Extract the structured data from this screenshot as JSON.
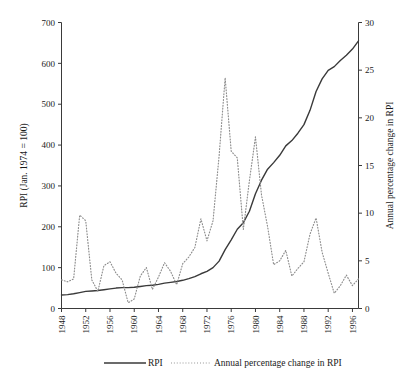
{
  "chart_data": {
    "type": "line",
    "title": "",
    "xlabel": "",
    "ylabel": "RPI (Jan. 1974 = 100)",
    "y2label": "Annual percentage change in RPI",
    "xlim": [
      1948,
      1997
    ],
    "ylim": [
      0,
      700
    ],
    "y2lim": [
      0,
      30
    ],
    "grid": false,
    "legend_position": "bottom",
    "xticks": [
      1948,
      1952,
      1956,
      1960,
      1964,
      1968,
      1972,
      1976,
      1980,
      1984,
      1988,
      1992,
      1996
    ],
    "xtick_labels": [
      "1948",
      "1952",
      "1956",
      "1960",
      "1964",
      "1968",
      "1972",
      "1976",
      "1980",
      "1984",
      "1988",
      "1992",
      "1996"
    ],
    "yticks": [
      0,
      100,
      200,
      300,
      400,
      500,
      600,
      700
    ],
    "ytick_labels": [
      "0",
      "100",
      "200",
      "300",
      "400",
      "500",
      "600",
      "700"
    ],
    "y2ticks": [
      0,
      5,
      10,
      15,
      20,
      25,
      30
    ],
    "y2tick_labels": [
      "0",
      "5",
      "10",
      "15",
      "20",
      "25",
      "30"
    ],
    "x": [
      1948,
      1949,
      1950,
      1951,
      1952,
      1953,
      1954,
      1955,
      1956,
      1957,
      1958,
      1959,
      1960,
      1961,
      1962,
      1963,
      1964,
      1965,
      1966,
      1967,
      1968,
      1969,
      1970,
      1971,
      1972,
      1973,
      1974,
      1975,
      1976,
      1977,
      1978,
      1979,
      1980,
      1981,
      1982,
      1983,
      1984,
      1985,
      1986,
      1987,
      1988,
      1989,
      1990,
      1991,
      1992,
      1993,
      1994,
      1995,
      1996,
      1997
    ],
    "series": [
      {
        "name": "RPI",
        "axis": "left",
        "style": "solid",
        "color": "#3a3a3a",
        "values": [
          33,
          34,
          36,
          39,
          42,
          43,
          44,
          46,
          48,
          50,
          51,
          51,
          52,
          54,
          56,
          57,
          59,
          62,
          64,
          66,
          69,
          73,
          78,
          85,
          91,
          100,
          116,
          144,
          168,
          194,
          210,
          238,
          281,
          314,
          341,
          357,
          375,
          398,
          411,
          429,
          450,
          485,
          531,
          562,
          583,
          592,
          607,
          620,
          635,
          655
        ]
      },
      {
        "name": "Annual percentage change in RPI",
        "axis": "right",
        "style": "dotted",
        "color": "#8d8d8d",
        "values": [
          3.0,
          2.8,
          3.1,
          9.8,
          9.2,
          3.0,
          1.8,
          4.5,
          4.9,
          3.7,
          3.0,
          0.6,
          1.0,
          3.4,
          4.3,
          2.0,
          3.3,
          4.8,
          3.9,
          2.5,
          4.7,
          5.4,
          6.4,
          9.4,
          7.1,
          9.2,
          16.0,
          24.2,
          16.5,
          15.8,
          8.3,
          13.4,
          18.0,
          11.9,
          8.6,
          4.6,
          5.0,
          6.1,
          3.4,
          4.2,
          4.9,
          7.8,
          9.5,
          5.9,
          3.7,
          1.6,
          2.4,
          3.5,
          2.4,
          3.1
        ]
      }
    ]
  },
  "legend": {
    "items": [
      {
        "label": "RPI",
        "style": "solid"
      },
      {
        "label": "Annual percentage change in RPI",
        "style": "dotted"
      }
    ]
  },
  "axis_titles": {
    "left": "RPI (Jan. 1974 = 100)",
    "right": "Annual percentage change in RPI"
  }
}
